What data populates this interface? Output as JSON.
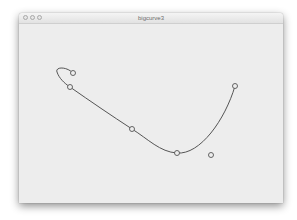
{
  "window": {
    "title": "bigcurve3",
    "buttons": [
      {
        "name": "close-button",
        "color": "#e6e6e6"
      },
      {
        "name": "minimize-button",
        "color": "#e6e6e6"
      },
      {
        "name": "zoom-button",
        "color": "#e6e6e6"
      }
    ]
  },
  "canvas": {
    "background": "#ededed",
    "curve_color": "#555555",
    "curve_points": [
      {
        "label": "p1",
        "x": 73,
        "y": 73
      },
      {
        "label": "p2",
        "x": 70,
        "y": 87
      },
      {
        "label": "p3",
        "x": 132,
        "y": 129
      },
      {
        "label": "p4",
        "x": 177,
        "y": 153
      },
      {
        "label": "p5",
        "x": 235,
        "y": 86
      }
    ],
    "free_point": {
      "label": "control",
      "x": 211,
      "y": 155
    }
  }
}
